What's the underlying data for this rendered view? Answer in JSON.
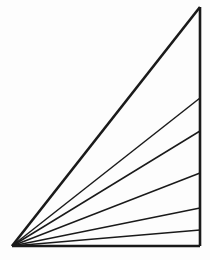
{
  "figure": {
    "background_color": "#fdfdfd",
    "stroke_color": "#1a1a1a",
    "canvas": {
      "width": 210,
      "height": 260
    },
    "vertices": {
      "apex_label": "lower-left apex",
      "apex": {
        "x": 12,
        "y": 246
      },
      "top_label": "top vertex",
      "top": {
        "x": 200,
        "y": 7
      },
      "bottom_right_label": "lower-right vertex",
      "bottom_right": {
        "x": 200,
        "y": 246
      }
    },
    "outline": {
      "name": "triangle-outline",
      "points": "12,246 200,7 200,246 12,246",
      "stroke_width": 2.6
    },
    "base_edge": {
      "name": "base-edge",
      "x1": 12,
      "y1": 246,
      "x2": 200,
      "y2": 246,
      "stroke_width": 2.6
    },
    "right_edge": {
      "name": "right-edge",
      "x1": 200,
      "y1": 7,
      "x2": 200,
      "y2": 246,
      "stroke_width": 2.6
    },
    "hypotenuse": {
      "name": "hypotenuse",
      "x1": 12,
      "y1": 246,
      "x2": 200,
      "y2": 7,
      "stroke_width": 2.6
    },
    "rays": [
      {
        "name": "ray-1",
        "x1": 12,
        "y1": 246,
        "x2": 200,
        "y2": 98,
        "stroke_width": 1.5
      },
      {
        "name": "ray-2",
        "x1": 12,
        "y1": 246,
        "x2": 200,
        "y2": 131,
        "stroke_width": 1.5
      },
      {
        "name": "ray-3",
        "x1": 12,
        "y1": 246,
        "x2": 200,
        "y2": 173,
        "stroke_width": 1.5
      },
      {
        "name": "ray-4",
        "x1": 12,
        "y1": 246,
        "x2": 200,
        "y2": 208,
        "stroke_width": 1.5
      },
      {
        "name": "ray-5",
        "x1": 12,
        "y1": 246,
        "x2": 200,
        "y2": 230,
        "stroke_width": 1.5
      }
    ]
  }
}
